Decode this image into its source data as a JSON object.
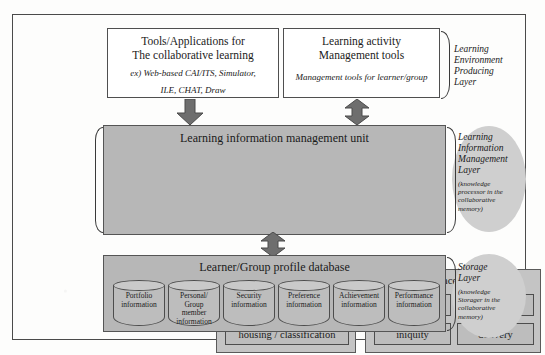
{
  "diagram": {
    "colors": {
      "panel_gray": "#b7b7b7",
      "module_gray": "#c4c4c4",
      "cell_gray": "#bdbdbd",
      "ellipse_gray": "#cfcfcf",
      "frame": "#4a4a4a",
      "arrow": "#6e6e6e"
    }
  },
  "top_layer": {
    "tools_box": {
      "title_line1": "Tools/Applications for",
      "title_line2": "The collaborative learning",
      "example_line1": "ex) Web-based CAI/ITS, Simulator,",
      "example_line2": "ILE, CHAT, Draw"
    },
    "management_box": {
      "title_line1": "Learning activity",
      "title_line2": "Management tools",
      "example_line1": "Management tools for learner/group"
    },
    "layer_label": "Learning\nEnvironment\nProducing\nLayer"
  },
  "middle_layer": {
    "unit_title": "Learning information management unit",
    "storage_module": {
      "title": "Storage module",
      "cells": [
        "arrangement",
        "housing / classification"
      ]
    },
    "reference_module": {
      "title": "Reference module",
      "cells": [
        "reference",
        "visualization",
        "iniquity",
        "delivery"
      ]
    },
    "left_label": "Collaborative\nMemory",
    "layer_label": "Learning\nInformation\nManagement\nLayer",
    "layer_note": "(knowledge\nprocessor in the\ncollaborative\nmemory)"
  },
  "bottom_layer": {
    "db_title": "Learner/Group profile database",
    "cylinders": [
      "Portfolio\ninformation",
      "Personal/\nGroup\nmember\ninformation",
      "Security\ninformation",
      "Preference\ninformation",
      "Achievement\ninformation",
      "Performance\ninformation"
    ],
    "layer_label": "Storage\nLayer",
    "layer_note": "(knowledge\nStorager in the\ncollaborative\nmemory)"
  },
  "arrows": {
    "tools_to_unit": "arrow-down",
    "management_to_unit": "arrow-up-down",
    "unit_to_database": "arrow-up-down"
  }
}
